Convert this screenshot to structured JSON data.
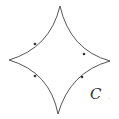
{
  "diagram": {
    "curve_label": "C",
    "trailing_mark": ".",
    "stroke_color": "#555555",
    "cusps": {
      "top": [
        60,
        6
      ],
      "left": [
        9,
        60
      ],
      "right": [
        110,
        61
      ],
      "bottom": [
        58,
        114
      ]
    },
    "orientation": "counterclockwise",
    "arrow_markers": 4
  }
}
